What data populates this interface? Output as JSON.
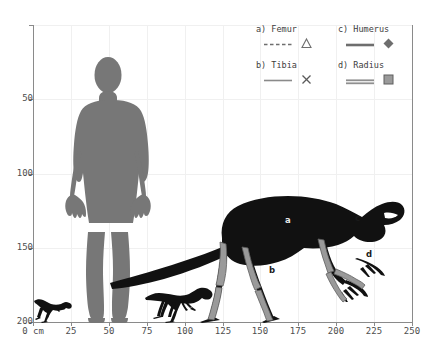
{
  "chart_data": {
    "type": "scatter",
    "title": "",
    "xlabel": "cm",
    "ylabel": "",
    "xlim": [
      0,
      250
    ],
    "ylim": [
      0,
      200
    ],
    "grid": true,
    "legend_position": "top-right",
    "x_ticks": [
      {
        "value": 0,
        "label": "0"
      },
      {
        "value": 25,
        "label": "25"
      },
      {
        "value": 50,
        "label": "50"
      },
      {
        "value": 75,
        "label": "75"
      },
      {
        "value": 100,
        "label": "100"
      },
      {
        "value": 125,
        "label": "125"
      },
      {
        "value": 150,
        "label": "150"
      },
      {
        "value": 175,
        "label": "175"
      },
      {
        "value": 200,
        "label": "200"
      },
      {
        "value": 225,
        "label": "225"
      },
      {
        "value": 250,
        "label": "250"
      }
    ],
    "x_unit_label": "cm",
    "y_ticks": [
      {
        "value": 0,
        "label": "0"
      },
      {
        "value": 50,
        "label": "50"
      },
      {
        "value": 100,
        "label": "100"
      },
      {
        "value": 150,
        "label": "150"
      },
      {
        "value": 200,
        "label": "200"
      }
    ],
    "series": [
      {
        "name": "a) Femur",
        "key": "a",
        "line_style": "dashed",
        "marker": "triangle",
        "marker_filled": false,
        "color": "#6e6e6e"
      },
      {
        "name": "b) Tibia",
        "key": "b",
        "line_style": "solid",
        "marker": "x",
        "marker_filled": false,
        "color": "#6e6e6e"
      },
      {
        "name": "c) Humerus",
        "key": "c",
        "line_style": "solid-thick",
        "marker": "diamond",
        "marker_filled": true,
        "color": "#6e6e6e"
      },
      {
        "name": "d) Radius",
        "key": "d",
        "line_style": "double",
        "marker": "square",
        "marker_filled": true,
        "color": "#6e6e6e"
      }
    ]
  },
  "legend": {
    "entries": [
      {
        "label": "a) Femur"
      },
      {
        "label": "b) Tibia"
      },
      {
        "label": "c) Humerus"
      },
      {
        "label": "d) Radius"
      }
    ]
  },
  "axes": {
    "y_labels": [
      "200",
      "150",
      "100",
      "50",
      ""
    ],
    "x_labels": [
      "0  cm",
      "25",
      "50",
      "75",
      "100",
      "125",
      "150",
      "175",
      "200",
      "225",
      "250"
    ]
  },
  "figures": {
    "human": {
      "name": "human-silhouette",
      "color": "#777777",
      "height_cm": 180
    },
    "main_dinosaur": {
      "name": "dinosaur-silhouette-large",
      "color": "#111111"
    },
    "small_dinosaur_1": {
      "name": "dinosaur-silhouette-small",
      "color": "#111111"
    },
    "small_dinosaur_2": {
      "name": "dinosaur-silhouette-medium",
      "color": "#111111"
    }
  },
  "bone_labels": [
    {
      "key": "a",
      "text": "a",
      "bone": "femur"
    },
    {
      "key": "b",
      "text": "b",
      "bone": "tibia"
    },
    {
      "key": "c",
      "text": "c",
      "bone": "humerus"
    },
    {
      "key": "d",
      "text": "d",
      "bone": "radius"
    }
  ],
  "colors": {
    "background": "#ffffff",
    "grid": "#f0f0f0",
    "axis": "#8a8a8a",
    "tick_text": "#4d4d4d",
    "human": "#777777",
    "dinosaur": "#111111",
    "bone": "#9a9a9a"
  }
}
